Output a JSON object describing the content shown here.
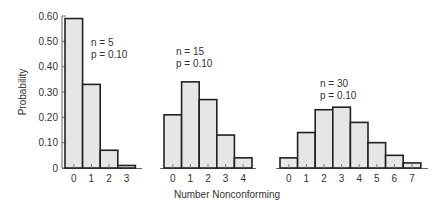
{
  "chart_data": [
    {
      "type": "bar",
      "title": "n = 5, p = 0.10",
      "annotation": [
        "n = 5",
        "p = 0.10"
      ],
      "categories": [
        "0",
        "1",
        "2",
        "3"
      ],
      "values": [
        0.59,
        0.33,
        0.07,
        0.01
      ],
      "xlabel": "Number Nonconforming",
      "ylabel": "Probability",
      "ylim": [
        0,
        0.6
      ],
      "yticks": [
        "0",
        "0.10",
        "0.20",
        "0.30",
        "0.40",
        "0.50",
        "0.60"
      ]
    },
    {
      "type": "bar",
      "title": "n = 15, p = 0.10",
      "annotation": [
        "n = 15",
        "p = 0.10"
      ],
      "categories": [
        "0",
        "1",
        "2",
        "3",
        "4"
      ],
      "values": [
        0.21,
        0.34,
        0.27,
        0.13,
        0.04
      ],
      "xlabel": "Number Nonconforming",
      "ylabel": "Probability",
      "ylim": [
        0,
        0.6
      ]
    },
    {
      "type": "bar",
      "title": "n = 30, p = 0.10",
      "annotation": [
        "n = 30",
        "p = 0.10"
      ],
      "categories": [
        "0",
        "1",
        "2",
        "3",
        "4",
        "5",
        "6",
        "7"
      ],
      "values": [
        0.04,
        0.14,
        0.23,
        0.24,
        0.18,
        0.1,
        0.05,
        0.02
      ],
      "xlabel": "Number Nonconforming",
      "ylabel": "Probability",
      "ylim": [
        0,
        0.6
      ]
    }
  ],
  "labels": {
    "ylabel": "Probability",
    "xlabel": "Number Nonconforming"
  }
}
